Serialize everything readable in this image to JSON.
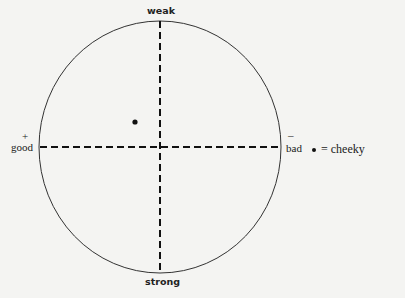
{
  "diagram": {
    "type": "quadrant-circle",
    "axes": {
      "vertical": {
        "top_label": "weak",
        "bottom_label": "strong"
      },
      "horizontal": {
        "left_label": "good",
        "left_sign": "+",
        "right_label": "bad",
        "right_sign": "–"
      }
    },
    "points": [
      {
        "label": "cheeky",
        "x": -0.2,
        "y": 0.2
      }
    ],
    "legend": {
      "symbol": "•",
      "text": "= cheeky"
    },
    "colors": {
      "line": "#1a1a1a",
      "background": "#f4f4f2"
    }
  }
}
